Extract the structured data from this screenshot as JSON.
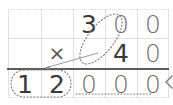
{
  "worksheet": {
    "title": "multiplication-grid-worksheet",
    "grid": {
      "columns": 5,
      "rows": 3,
      "col_x": [
        8,
        41,
        73,
        105,
        137,
        169
      ],
      "row_y": [
        9,
        38,
        68,
        98
      ],
      "line_color": "#e2e0dd",
      "rule_color": "#5c5c5c"
    },
    "rows": [
      {
        "name": "multiplicand-row",
        "cells": [
          "",
          "",
          "3",
          "0",
          "0"
        ]
      },
      {
        "name": "multiplier-row",
        "cells": [
          "",
          "×",
          "",
          "4",
          "0"
        ]
      },
      {
        "name": "product-row",
        "cells": [
          "1",
          "2",
          "0",
          "0",
          "0"
        ]
      }
    ],
    "annotations": {
      "digit_ellipse": {
        "name": "dotted-ellipse-around-3-and-4",
        "encircles": [
          "3",
          "4"
        ],
        "color": "#7a7a7a"
      },
      "product_box": {
        "name": "dotted-box-around-12",
        "encircles": [
          "1",
          "2"
        ],
        "color": "#7a7a7a"
      },
      "zeros_underline": {
        "name": "dotted-underline-under-zeros",
        "underlines": [
          "0",
          "0",
          "0"
        ],
        "color": "#8a8a8a"
      },
      "connector_line": {
        "name": "connector-line-to-product",
        "color": "#9a9a9a"
      },
      "right_mark": {
        "name": "less-than-mark",
        "symbol": "<",
        "color": "#7a7a7a"
      }
    }
  }
}
